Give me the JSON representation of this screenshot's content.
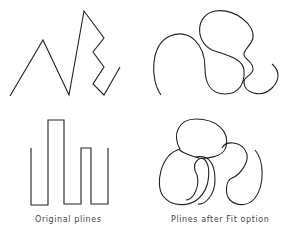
{
  "diagram": {
    "stroke_color": "#222222",
    "background": "#ffffff",
    "panels": [
      {
        "id": "original-zigzag",
        "description": "Original polyline: zigzag / spring shape"
      },
      {
        "id": "fit-zigzag",
        "description": "Zigzag polyline after Fit option: looping curve"
      },
      {
        "id": "original-bars",
        "description": "Original polyline: square-wave bar shape"
      },
      {
        "id": "fit-bars",
        "description": "Bar polyline after Fit option: overlapping circular loops"
      }
    ],
    "captions": {
      "left": "Original plines",
      "right": "Plines after Fit option"
    }
  }
}
